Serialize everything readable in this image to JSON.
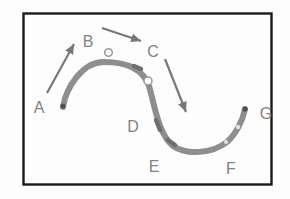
{
  "figure": {
    "type": "s-curve-motion-diagram",
    "labels": [
      {
        "text": "A"
      },
      {
        "text": "B"
      },
      {
        "text": "C"
      },
      {
        "text": "D"
      },
      {
        "text": "E"
      },
      {
        "text": "F"
      },
      {
        "text": "G"
      }
    ],
    "colors": {
      "background": "#fdfdfd",
      "frame": "#1b1b1b",
      "curve": "#8e8e8e",
      "arrow": "#787878",
      "label": "#828282",
      "endpoint_dot": "#515151",
      "marker_circle_stroke": "#999999"
    }
  }
}
